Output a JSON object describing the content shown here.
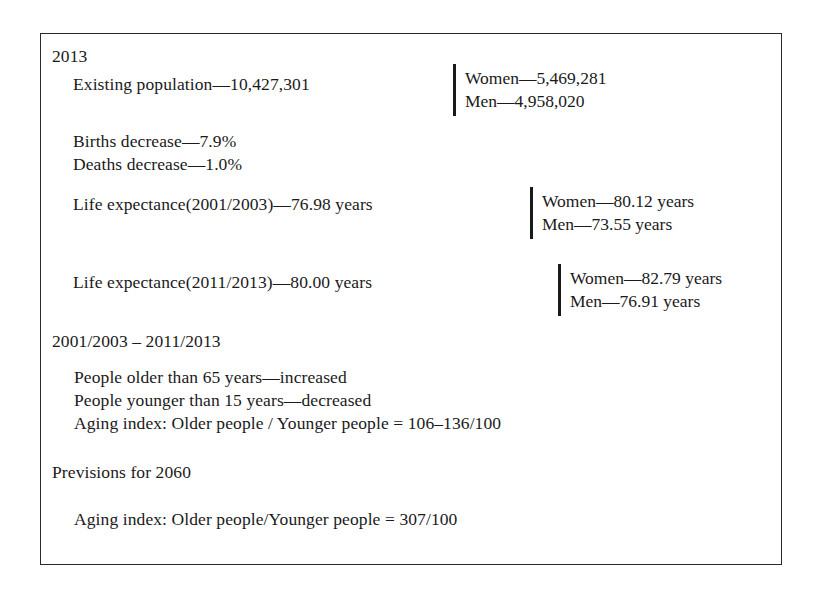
{
  "figure": {
    "sections": {
      "year_2013_heading": "2013",
      "existing_population": "Existing population—10,427,301",
      "births_decrease": "Births decrease—7.9%",
      "deaths_decrease": "Deaths decrease—1.0%",
      "life_expectance_2001_2003": "Life expectance(2001/2003)—76.98 years",
      "life_expectance_2011_2013": "Life expectance(2011/2013)—80.00 years",
      "period_heading": "2001/2003 – 2011/2013",
      "older_than_65": "People older than 65 years—increased",
      "younger_than_15": "People younger than 15 years—decreased",
      "aging_index_period": "Aging index: Older people / Younger people = 106–136/100",
      "previsions_heading": "Previsions for 2060",
      "aging_index_2060": "Aging index: Older people/Younger people = 307/100"
    },
    "breakdowns": {
      "population": {
        "women": "Women—5,469,281",
        "men": "Men—4,958,020"
      },
      "life_expectance_2001_2003": {
        "women": "Women—80.12 years",
        "men": "Men—73.55 years"
      },
      "life_expectance_2011_2013": {
        "women": "Women—82.79 years",
        "men": "Men—76.91 years"
      }
    },
    "colors": {
      "border": "#2b2b2b",
      "text": "#1a1a1a",
      "background": "#ffffff",
      "brace": "#1a1a1a"
    }
  }
}
